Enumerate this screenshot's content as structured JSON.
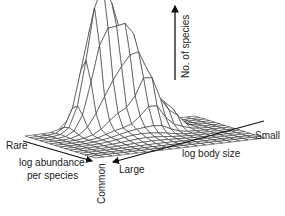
{
  "chart_data": {
    "type": "surface3d",
    "title": "",
    "axes": {
      "z": {
        "label": "No. of species",
        "direction": "up"
      },
      "x": {
        "label": "log abundance per species",
        "low_end": "Rare",
        "high_end": "Common"
      },
      "y": {
        "label": "log body size",
        "low_end": "Large",
        "high_end": "Small"
      }
    },
    "grid": {
      "rows": 14,
      "cols": 20
    },
    "peaks": [
      {
        "name": "main",
        "rel_height": 1.0
      },
      {
        "name": "secondary",
        "rel_height": 0.82
      },
      {
        "name": "shoulder",
        "rel_height": 0.75
      },
      {
        "name": "minor-back",
        "rel_height": 0.3
      }
    ]
  },
  "labels": {
    "z_axis": "No. of species",
    "rare": "Rare",
    "abundance_l1": "log abundance",
    "abundance_l2": "per species",
    "common": "Common",
    "large": "Large",
    "body_size": "log body size",
    "small": "Small"
  }
}
